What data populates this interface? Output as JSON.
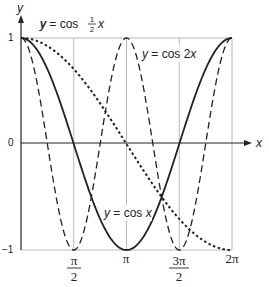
{
  "chart_data": {
    "type": "line",
    "title": "",
    "xlabel": "x",
    "ylabel": "y",
    "xlim": [
      0,
      6.2832
    ],
    "ylim": [
      -1,
      1
    ],
    "grid": true,
    "legend": "inline annotations",
    "x_ticks": [
      {
        "value": 1.5708,
        "label_num": "π",
        "label_den": "2",
        "label": "π/2"
      },
      {
        "value": 3.1416,
        "label": "π"
      },
      {
        "value": 4.7124,
        "label_num": "3π",
        "label_den": "2",
        "label": "3π/2"
      },
      {
        "value": 6.2832,
        "label": "2π"
      }
    ],
    "y_ticks": [
      {
        "value": 1,
        "label": "1"
      },
      {
        "value": 0,
        "label": "0"
      },
      {
        "value": -1,
        "label": "−1"
      }
    ],
    "series": [
      {
        "name": "y = cos x",
        "style": "solid",
        "function": "cos(x)",
        "x": [
          0,
          0.7854,
          1.5708,
          2.3562,
          3.1416,
          3.927,
          4.7124,
          5.4978,
          6.2832
        ],
        "y": [
          1,
          0.707,
          0,
          -0.707,
          -1,
          -0.707,
          0,
          0.707,
          1
        ]
      },
      {
        "name": "y = cos 2x",
        "style": "dashed",
        "function": "cos(2x)",
        "x": [
          0,
          0.7854,
          1.5708,
          2.3562,
          3.1416,
          3.927,
          4.7124,
          5.4978,
          6.2832
        ],
        "y": [
          1,
          0,
          -1,
          0,
          1,
          0,
          -1,
          0,
          1
        ]
      },
      {
        "name": "y = cos ½x",
        "style": "dotted",
        "function": "cos(x/2)",
        "x": [
          0,
          1.5708,
          3.1416,
          4.7124,
          6.2832
        ],
        "y": [
          1,
          0.707,
          0,
          -0.707,
          -1
        ]
      }
    ],
    "annotations": {
      "half": {
        "pre": "y = cos ",
        "num": "1",
        "den": "2",
        "post": "x"
      },
      "double": {
        "pre": "y = cos 2",
        "post": "x"
      },
      "single": {
        "pre": "y = cos ",
        "post": "x"
      }
    }
  }
}
